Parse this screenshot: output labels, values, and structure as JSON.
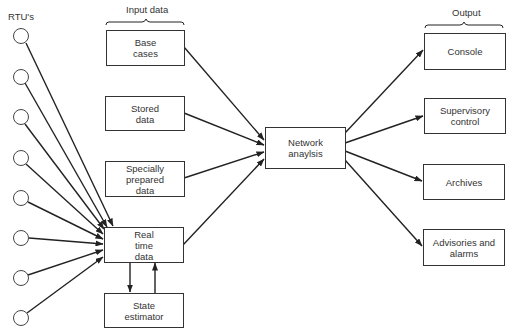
{
  "diagram": {
    "labels": {
      "rtus": "RTU's",
      "input_group": "Input data",
      "output_group": "Output"
    },
    "rtu_count": 8,
    "inputs": [
      {
        "id": "base-cases",
        "label": "Base\ncases"
      },
      {
        "id": "stored-data",
        "label": "Stored\ndata"
      },
      {
        "id": "specially-prepared-data",
        "label": "Specially\nprepared\ndata"
      },
      {
        "id": "real-time-data",
        "label": "Real\ntime\ndata"
      }
    ],
    "state_estimator": {
      "id": "state-estimator",
      "label": "State\nestimator"
    },
    "network_analysis": {
      "id": "network-analysis",
      "label": "Network\nanaylsis"
    },
    "outputs": [
      {
        "id": "console",
        "label": "Console"
      },
      {
        "id": "supervisory-control",
        "label": "Supervisory\ncontrol"
      },
      {
        "id": "archives",
        "label": "Archives"
      },
      {
        "id": "advisories-and-alarms",
        "label": "Advisories and\nalarms"
      }
    ],
    "edges": [
      {
        "from": "rtu-1..8",
        "to": "real-time-data"
      },
      {
        "from": "base-cases",
        "to": "network-analysis"
      },
      {
        "from": "stored-data",
        "to": "network-analysis"
      },
      {
        "from": "specially-prepared-data",
        "to": "network-analysis"
      },
      {
        "from": "real-time-data",
        "to": "network-analysis"
      },
      {
        "from": "real-time-data",
        "to": "state-estimator"
      },
      {
        "from": "state-estimator",
        "to": "real-time-data"
      },
      {
        "from": "network-analysis",
        "to": "console"
      },
      {
        "from": "network-analysis",
        "to": "supervisory-control"
      },
      {
        "from": "network-analysis",
        "to": "archives"
      },
      {
        "from": "network-analysis",
        "to": "advisories-and-alarms"
      }
    ]
  }
}
